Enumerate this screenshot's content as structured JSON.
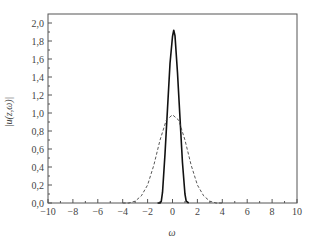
{
  "chart_data": {
    "type": "line",
    "title": "",
    "xlabel": "ω",
    "ylabel": "|u(z,ω)|",
    "xlim": [
      -10,
      10
    ],
    "ylim": [
      0,
      2.06
    ],
    "x_ticks": [
      -10,
      -8,
      -6,
      -4,
      -2,
      0,
      2,
      4,
      6,
      8,
      10
    ],
    "x_tick_labels": [
      "−10",
      "−8",
      "−6",
      "−4",
      "−2",
      "0",
      "2",
      "4",
      "6",
      "8",
      "10"
    ],
    "y_ticks": [
      0,
      0.2,
      0.4,
      0.6,
      0.8,
      1.0,
      1.2,
      1.4,
      1.6,
      1.8,
      2.0
    ],
    "y_tick_labels": [
      "0,0",
      "0,2",
      "0,4",
      "0,6",
      "0,8",
      "1,0",
      "1,2",
      "1,4",
      "1,6",
      "1,8",
      "2,0"
    ],
    "grid": false,
    "legend": null,
    "series": [
      {
        "name": "solid",
        "style": "solid",
        "color": "#111111",
        "peak": 1.92,
        "center": 0.1,
        "x": [
          -1.2,
          -1.0,
          -0.9,
          -0.8,
          -0.6,
          -0.4,
          -0.2,
          0.0,
          0.1,
          0.2,
          0.4,
          0.6,
          0.8,
          1.0,
          1.1,
          1.3
        ],
        "values": [
          0.0,
          0.0,
          0.02,
          0.12,
          0.55,
          1.05,
          1.55,
          1.85,
          1.92,
          1.86,
          1.45,
          0.95,
          0.45,
          0.1,
          0.02,
          0.0
        ]
      },
      {
        "name": "dashed",
        "style": "dashed",
        "color": "#444444",
        "peak": 0.98,
        "center": 0.0,
        "x": [
          -4.0,
          -3.5,
          -3.0,
          -2.5,
          -2.0,
          -1.5,
          -1.0,
          -0.5,
          0.0,
          0.5,
          1.0,
          1.5,
          2.0,
          2.5,
          3.0,
          3.5,
          4.0
        ],
        "values": [
          0.0,
          0.0,
          0.02,
          0.08,
          0.2,
          0.42,
          0.7,
          0.92,
          0.98,
          0.92,
          0.7,
          0.42,
          0.2,
          0.08,
          0.02,
          0.0,
          0.0
        ]
      }
    ]
  },
  "axes": {
    "x_title": "ω",
    "y_title": "|u(z,ω)|"
  }
}
